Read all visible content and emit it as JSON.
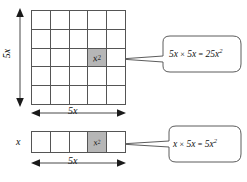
{
  "diagram": {
    "colors": {
      "shaded_cell": "#b6b6b6",
      "line": "#555555",
      "text": "#111111",
      "background": "#ffffff"
    },
    "big_square": {
      "name": "5x by 5x square grid",
      "rows": 5,
      "columns": 5,
      "shaded_cell_row": 3,
      "shaded_cell_column": 4,
      "shaded_cell_label": "x",
      "shaded_cell_exponent": "2",
      "left_dimension_label": "5x",
      "bottom_dimension_label": "5x"
    },
    "bar": {
      "name": "x by 5x rectangle strip",
      "rows": 1,
      "columns": 5,
      "shaded_cell_index": 4,
      "shaded_cell_label": "x",
      "shaded_cell_exponent": "2",
      "left_dimension_label": "x",
      "bottom_dimension_label": "5x"
    },
    "callouts": [
      {
        "name": "callout-square-area",
        "lhs": "5x",
        "operator": "×",
        "rhs": "5x",
        "equals": "=",
        "result_coefficient": "25x",
        "result_exponent": "2",
        "full_text": "5x × 5x = 25x²"
      },
      {
        "name": "callout-bar-area",
        "lhs": "x",
        "operator": "×",
        "rhs": "5x",
        "equals": "=",
        "result_coefficient": "5x",
        "result_exponent": "2",
        "full_text": "x × 5x = 5x²"
      }
    ]
  }
}
